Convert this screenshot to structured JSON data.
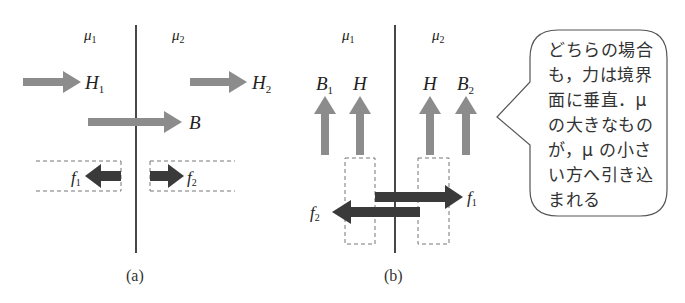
{
  "panel_a": {
    "caption": "(a)",
    "medium_left": "μ",
    "medium_left_sub": "1",
    "medium_right": "μ",
    "medium_right_sub": "2",
    "h1_label": "H",
    "h1_sub": "1",
    "h2_label": "H",
    "h2_sub": "2",
    "b_label": "B",
    "f1_label": "f",
    "f1_sub": "1",
    "f2_label": "f",
    "f2_sub": "2"
  },
  "panel_b": {
    "caption": "(b)",
    "medium_left": "μ",
    "medium_left_sub": "1",
    "medium_right": "μ",
    "medium_right_sub": "2",
    "b1_label": "B",
    "b1_sub": "1",
    "h_left_label": "H",
    "h_right_label": "H",
    "b2_label": "B",
    "b2_sub": "2",
    "f1_label": "f",
    "f1_sub": "1",
    "f2_label": "f",
    "f2_sub": "2"
  },
  "callout": {
    "text": "どちらの場合\nも，力は境界\n面に垂直．μ\nの大きなもの\nが，μ の小さ\nい方へ引き込\nまれる"
  },
  "colors": {
    "field_arrow": "#8c8c8c",
    "force_arrow": "#3a3a3a",
    "boundary_line": "#1a1a1a",
    "dashed_box": "#777777",
    "callout_border": "#555555"
  }
}
